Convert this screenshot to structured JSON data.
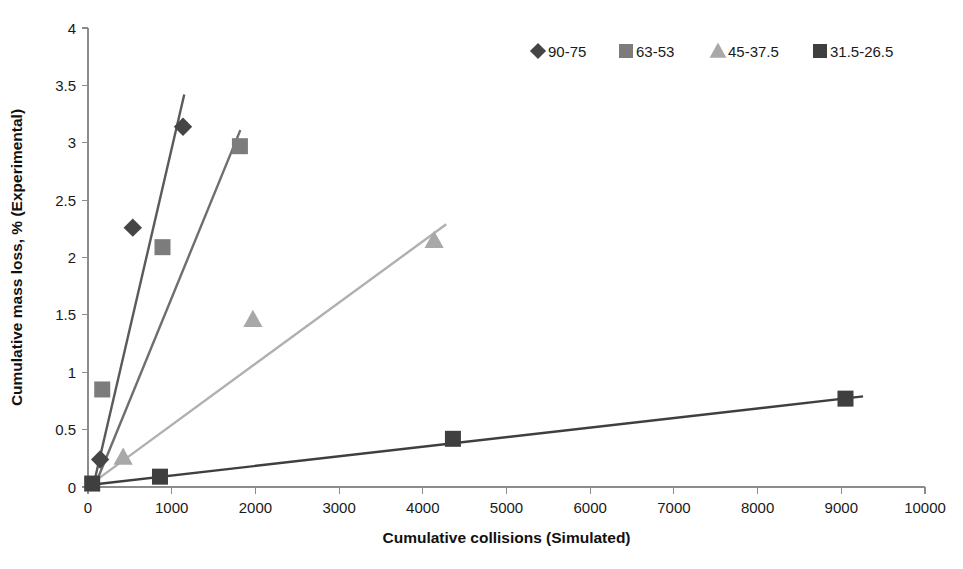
{
  "chart_data": {
    "type": "scatter",
    "title": "",
    "xlabel": "Cumulative collisions (Simulated)",
    "ylabel": "Cumulative mass loss, % (Experimental)",
    "xlim": [
      0,
      10000
    ],
    "ylim": [
      0,
      4
    ],
    "xticks": [
      0,
      1000,
      2000,
      3000,
      4000,
      5000,
      6000,
      7000,
      8000,
      9000,
      10000
    ],
    "yticks": [
      0,
      0.5,
      1,
      1.5,
      2,
      2.5,
      3,
      3.5,
      4
    ],
    "xtick_labels": [
      "0",
      "1000",
      "2000",
      "3000",
      "4000",
      "5000",
      "6000",
      "7000",
      "8000",
      "9000",
      "10000"
    ],
    "ytick_labels": [
      "0",
      "0.5",
      "1",
      "1.5",
      "2",
      "2.5",
      "3",
      "3.5",
      "4"
    ],
    "grid": false,
    "legend_position": "top-right",
    "series": [
      {
        "name": "90-75",
        "marker": "diamond",
        "color": "#454545",
        "line_color": "#5a5a5a",
        "points": [
          {
            "x": 145,
            "y": 0.24
          },
          {
            "x": 535,
            "y": 2.26
          },
          {
            "x": 1135,
            "y": 3.14
          }
        ],
        "trendline": {
          "x0": 60,
          "y0": 0.0,
          "x1": 1150,
          "y1": 3.42
        }
      },
      {
        "name": "63-53",
        "marker": "square",
        "color": "#7c7c7c",
        "line_color": "#6e6e6e",
        "points": [
          {
            "x": 170,
            "y": 0.85
          },
          {
            "x": 890,
            "y": 2.09
          },
          {
            "x": 1815,
            "y": 2.97
          }
        ],
        "trendline": {
          "x0": 75,
          "y0": 0.0,
          "x1": 1820,
          "y1": 3.11
        }
      },
      {
        "name": "45-37.5",
        "marker": "triangle",
        "color": "#a8a8a8",
        "line_color": "#b0b0b0",
        "points": [
          {
            "x": 420,
            "y": 0.26
          },
          {
            "x": 1970,
            "y": 1.46
          },
          {
            "x": 4135,
            "y": 2.15
          }
        ],
        "trendline": {
          "x0": 100,
          "y0": 0.06,
          "x1": 4280,
          "y1": 2.29
        }
      },
      {
        "name": "31.5-26.5",
        "marker": "square",
        "color": "#3f3f3f",
        "line_color": "#3f3f3f",
        "points": [
          {
            "x": 50,
            "y": 0.03
          },
          {
            "x": 860,
            "y": 0.09
          },
          {
            "x": 4360,
            "y": 0.42
          },
          {
            "x": 9050,
            "y": 0.77
          }
        ],
        "trendline": {
          "x0": 40,
          "y0": 0.02,
          "x1": 9260,
          "y1": 0.79
        }
      }
    ]
  },
  "legend": {
    "items": [
      {
        "label": "90-75",
        "marker": "diamond",
        "color": "#454545"
      },
      {
        "label": "63-53",
        "marker": "square",
        "color": "#7c7c7c"
      },
      {
        "label": "45-37.5",
        "marker": "triangle",
        "color": "#a8a8a8"
      },
      {
        "label": "31.5-26.5",
        "marker": "square",
        "color": "#3f3f3f"
      }
    ]
  }
}
